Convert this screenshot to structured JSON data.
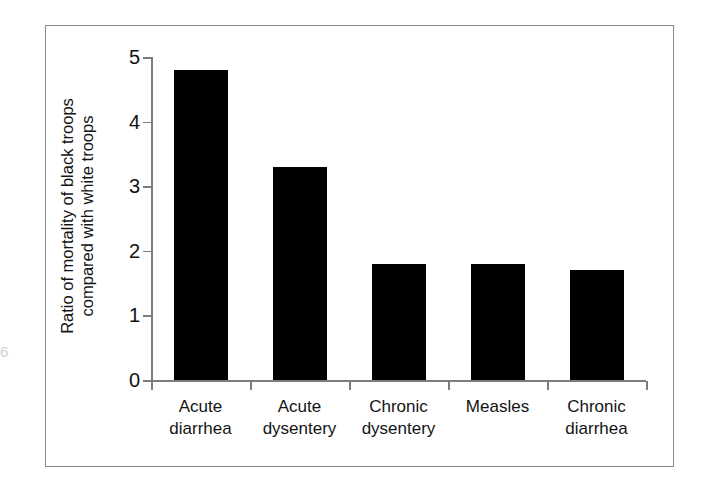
{
  "figure": {
    "edge_artifact": "6"
  },
  "chart_data": {
    "type": "bar",
    "title": "",
    "xlabel": "",
    "ylabel": "Ratio of mortality of black troops compared with white troops",
    "ylabel_lines": [
      "Ratio of mortality of black troops",
      "compared with white troops"
    ],
    "categories": [
      "Acute diarrhea",
      "Acute dysentery",
      "Chronic dysentery",
      "Measles",
      "Chronic diarrhea"
    ],
    "category_lines": [
      [
        "Acute",
        "diarrhea"
      ],
      [
        "Acute",
        "dysentery"
      ],
      [
        "Chronic",
        "dysentery"
      ],
      [
        "Measles",
        ""
      ],
      [
        "Chronic",
        "diarrhea"
      ]
    ],
    "values": [
      4.8,
      3.3,
      1.8,
      1.8,
      1.7
    ],
    "ylim": [
      0,
      5
    ],
    "yticks": [
      0,
      1,
      2,
      3,
      4,
      5
    ],
    "ytick_labels": [
      "0",
      "1",
      "2",
      "3",
      "4",
      "5"
    ],
    "grid": false,
    "legend": null,
    "bar_color": "#000000",
    "axis_color": "#7d7d7d",
    "frame_color": "#8a8a8a",
    "background": "#ffffff"
  }
}
